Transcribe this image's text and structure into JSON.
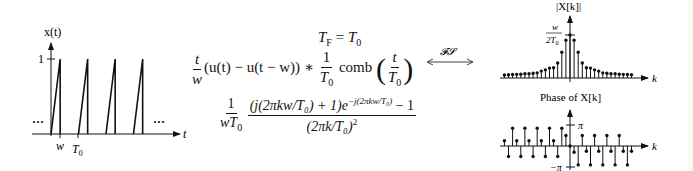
{
  "time_plot": {
    "ylabel": "x(t)",
    "xlabel": "t",
    "ytick": "1",
    "xtick_w": "w",
    "xtick_T0": "T",
    "xtick_T0_sub": "0",
    "ellipsis_left": "···",
    "ellipsis_right": "···",
    "num_periods_shown": 4,
    "w_over_T0": 0.333
  },
  "equation": {
    "line1_lhs": "T",
    "line1_lhs_sub": "F",
    "line1_eq": " = ",
    "line1_rhs": "T",
    "line1_rhs_sub": "0",
    "frac1_num": "t",
    "frac1_den": "w",
    "line2_mid": "(u(t) − u(t − w)) ∗ ",
    "frac2_num": "1",
    "frac2_den": "T",
    "frac2_den_sub": "0",
    "comb": " comb ",
    "frac3_num": "t",
    "frac3_den": "T",
    "frac3_den_sub": "0",
    "fs_label": "𝓕𝓢",
    "line3_frac_num": "1",
    "line3_frac_den": "wT",
    "line3_frac_den_sub": "0",
    "big_num": "(j(2πkw/T₀) + 1)e",
    "big_num_exp": "−j(2πkw/T₀)",
    "big_num_tail": " − 1",
    "big_den": "(2πk/T₀)",
    "big_den_exp": "2"
  },
  "chart_data": [
    {
      "type": "stem",
      "title": "|X[k]|",
      "xlabel": "k",
      "peak_label_num": "w",
      "peak_label_den": "2T",
      "peak_label_den_sub": "0",
      "k": [
        -16,
        -15,
        -14,
        -13,
        -12,
        -11,
        -10,
        -9,
        -8,
        -7,
        -6,
        -5,
        -4,
        -3,
        -2,
        -1,
        0,
        1,
        2,
        3,
        4,
        5,
        6,
        7,
        8,
        9,
        10,
        11,
        12,
        13,
        14,
        15
      ],
      "values_relative": [
        0.07,
        0.075,
        0.08,
        0.085,
        0.09,
        0.1,
        0.1,
        0.11,
        0.12,
        0.16,
        0.19,
        0.23,
        0.24,
        0.35,
        0.6,
        0.88,
        1.0,
        0.88,
        0.6,
        0.35,
        0.24,
        0.23,
        0.19,
        0.16,
        0.12,
        0.11,
        0.1,
        0.1,
        0.09,
        0.085,
        0.08,
        0.075
      ],
      "peak_value": "w/(2T0)"
    },
    {
      "type": "stem",
      "title": "Phase of X[k]",
      "xlabel": "k",
      "ytick_top": "π",
      "ytick_bottom": "−π",
      "k": [
        -16,
        -15,
        -14,
        -13,
        -12,
        -11,
        -10,
        -9,
        -8,
        -7,
        -6,
        -5,
        -4,
        -3,
        -2,
        -1,
        0,
        1,
        2,
        3,
        4,
        5,
        6,
        7,
        8,
        9,
        10,
        11,
        12,
        13,
        14,
        15
      ],
      "phase_over_pi": [
        0.25,
        -0.5,
        0.85,
        0.25,
        -0.5,
        0.85,
        0.25,
        -0.5,
        0.85,
        0.25,
        -0.5,
        0.85,
        0.25,
        -0.5,
        0.85,
        0.5,
        0,
        -0.3,
        -0.9,
        0.5,
        -0.25,
        -0.9,
        0.5,
        -0.25,
        -0.9,
        0.5,
        -0.25,
        -0.9,
        0.5,
        -0.25,
        -0.9,
        -0.25
      ],
      "ylim_over_pi": [
        -1,
        1
      ]
    }
  ]
}
